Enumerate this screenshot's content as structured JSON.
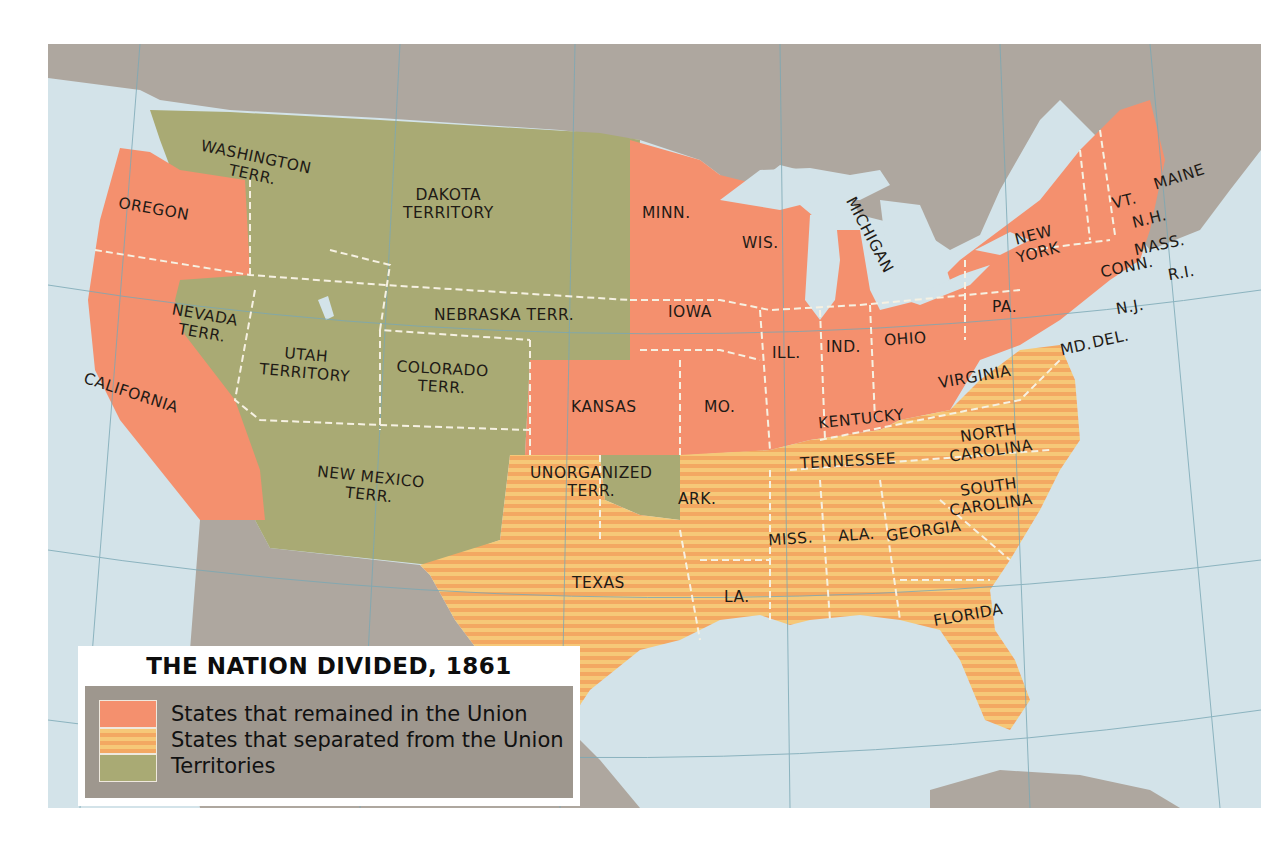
{
  "title": "THE NATION DIVIDED, 1861",
  "colors": {
    "union": "#f4906e",
    "confederate": "#f6c272",
    "confederate_stripe": "#f3a35f",
    "territory": "#a9aa74",
    "water": "#d3e3e9",
    "foreign_land": "#aea79f",
    "legend_bg": "#9e978e",
    "border_dash": "#f6f1e2"
  },
  "legend": {
    "title": "THE NATION DIVIDED, 1861",
    "items": [
      {
        "label": "States that remained in the Union",
        "category": "union"
      },
      {
        "label": "States that separated from the Union",
        "category": "confederate"
      },
      {
        "label": "Territories",
        "category": "territory"
      }
    ]
  },
  "regions": {
    "union": [
      "OREGON",
      "CALIFORNIA",
      "MINN.",
      "IOWA",
      "KANSAS",
      "MO.",
      "WIS.",
      "MICHIGAN",
      "ILL.",
      "IND.",
      "OHIO",
      "KENTUCKY",
      "PA.",
      "NEW YORK",
      "VT.",
      "N.H.",
      "MAINE",
      "MASS.",
      "CONN.",
      "R.I.",
      "N.J.",
      "DEL.",
      "MD."
    ],
    "confederate": [
      "VIRGINIA",
      "NORTH CAROLINA",
      "TENNESSEE",
      "SOUTH CAROLINA",
      "GEORGIA",
      "ALA.",
      "MISS.",
      "FLORIDA",
      "LA.",
      "ARK.",
      "TEXAS"
    ],
    "territory": [
      "WASHINGTON TERR.",
      "DAKOTA TERRITORY",
      "NEBRASKA TERR.",
      "NEVADA TERR.",
      "UTAH TERRITORY",
      "COLORADO TERR.",
      "NEW MEXICO TERR.",
      "UNORGANIZED TERR."
    ]
  },
  "labels": {
    "washington": [
      "WASHINGTON",
      "TERR."
    ],
    "oregon": "OREGON",
    "dakota": [
      "DAKOTA",
      "TERRITORY"
    ],
    "minn": "MINN.",
    "wis": "WIS.",
    "michigan": "MICHIGAN",
    "nebraska": "NEBRASKA  TERR.",
    "iowa": "IOWA",
    "nevada": [
      "NEVADA",
      "TERR."
    ],
    "utah": [
      "UTAH",
      "TERRITORY"
    ],
    "colorado": [
      "COLORADO",
      "TERR."
    ],
    "california": "CALIFORNIA",
    "kansas": "KANSAS",
    "mo": "MO.",
    "ill": "ILL.",
    "ind": "IND.",
    "ohio": "OHIO",
    "kentucky": "KENTUCKY",
    "virginia": "VIRGINIA",
    "pa": "PA.",
    "new_york": [
      "NEW",
      "YORK"
    ],
    "vt": "VT.",
    "nh": "N.H.",
    "maine": "MAINE",
    "mass": "MASS.",
    "conn": "CONN.",
    "ri": "R.I.",
    "nj": "N.J.",
    "md": "MD.",
    "del": "DEL.",
    "new_mexico": [
      "NEW  MEXICO",
      "TERR."
    ],
    "unorganized": [
      "UNORGANIZED",
      "TERR."
    ],
    "texas": "TEXAS",
    "ark": "ARK.",
    "la": "LA.",
    "miss": "MISS.",
    "ala": "ALA.",
    "georgia": "GEORGIA",
    "tennessee": "TENNESSEE",
    "north_carolina": [
      "NORTH",
      "CAROLINA"
    ],
    "south_carolina": [
      "SOUTH",
      "CAROLINA"
    ],
    "florida": "FLORIDA"
  }
}
